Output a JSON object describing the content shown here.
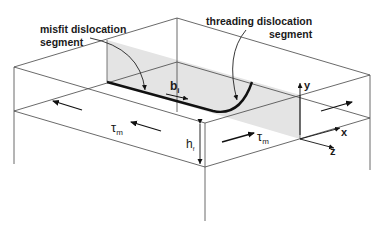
{
  "diagram": {
    "labels": {
      "misfit_line1": "misfit dislocation",
      "misfit_line2": "segment",
      "threading_line1": "threading dislocation",
      "threading_line2": "segment",
      "burgers_vector_base": "b",
      "burgers_vector_sub": "i",
      "stress_left_base": "τ",
      "stress_left_sub": "m",
      "stress_right_base": "τ",
      "stress_right_sub": "m",
      "thickness_base": "h",
      "thickness_sub": "f",
      "axis_x": "x",
      "axis_y": "y",
      "axis_z": "z"
    },
    "colors": {
      "line": "#3a3a3a",
      "dislocation": "#111111",
      "plane_fill": "#e4e4e4",
      "background": "#ffffff"
    }
  }
}
